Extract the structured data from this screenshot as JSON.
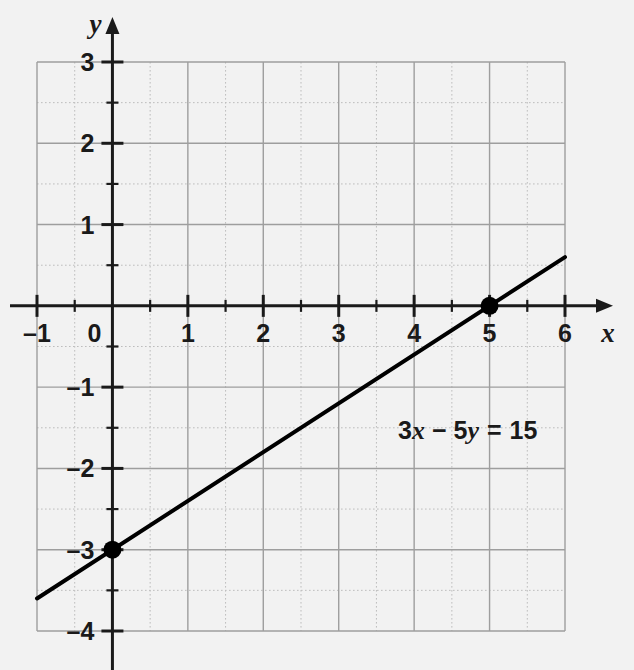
{
  "figure": {
    "background_color": "#f2f2f2",
    "width": 634,
    "height": 670
  },
  "chart_data": {
    "type": "line",
    "title": "",
    "xlabel": "x",
    "ylabel": "y",
    "equation_label": "3x − 5y = 15",
    "equation_parts": {
      "coef_x": "3",
      "var_x": "x",
      "minus": "−",
      "coef_y": "5",
      "var_y": "y",
      "equals": "=",
      "constant": "15"
    },
    "equation": {
      "form": "standard",
      "a": 3,
      "b": -5,
      "c": 15,
      "slope": 0.6,
      "y_intercept": -3,
      "x_intercept": 5
    },
    "series": [
      {
        "name": "3x − 5y = 15",
        "x": [
          -1,
          6
        ],
        "y": [
          -3.6,
          0.6
        ],
        "color": "#000000",
        "width": 4
      }
    ],
    "points": [
      {
        "label": "y-intercept",
        "x": 0,
        "y": -3,
        "style": "filled-circle",
        "color": "#000000"
      },
      {
        "label": "x-intercept",
        "x": 5,
        "y": 0,
        "style": "filled-circle",
        "color": "#000000"
      }
    ],
    "xlim": [
      -1,
      6
    ],
    "ylim": [
      -4,
      3
    ],
    "x_ticks": [
      -1,
      0,
      1,
      2,
      3,
      4,
      5,
      6
    ],
    "y_ticks": [
      3,
      2,
      1,
      -1,
      -2,
      -3,
      -4
    ],
    "x_tick_labels": [
      "–1",
      "0",
      "1",
      "2",
      "3",
      "4",
      "5",
      "6"
    ],
    "y_tick_labels": [
      "3",
      "2",
      "1",
      "–1",
      "–2",
      "–3",
      "–4"
    ],
    "minor_tick_step": 0.5,
    "grid": {
      "major": true,
      "minor": true,
      "major_color": "#9e9e9e",
      "minor_color": "#bdbdbd",
      "minor_style": "dotted"
    },
    "axis_color": "#1a1a1a",
    "arrows": [
      "x-positive",
      "y-positive"
    ],
    "legend": "none"
  }
}
